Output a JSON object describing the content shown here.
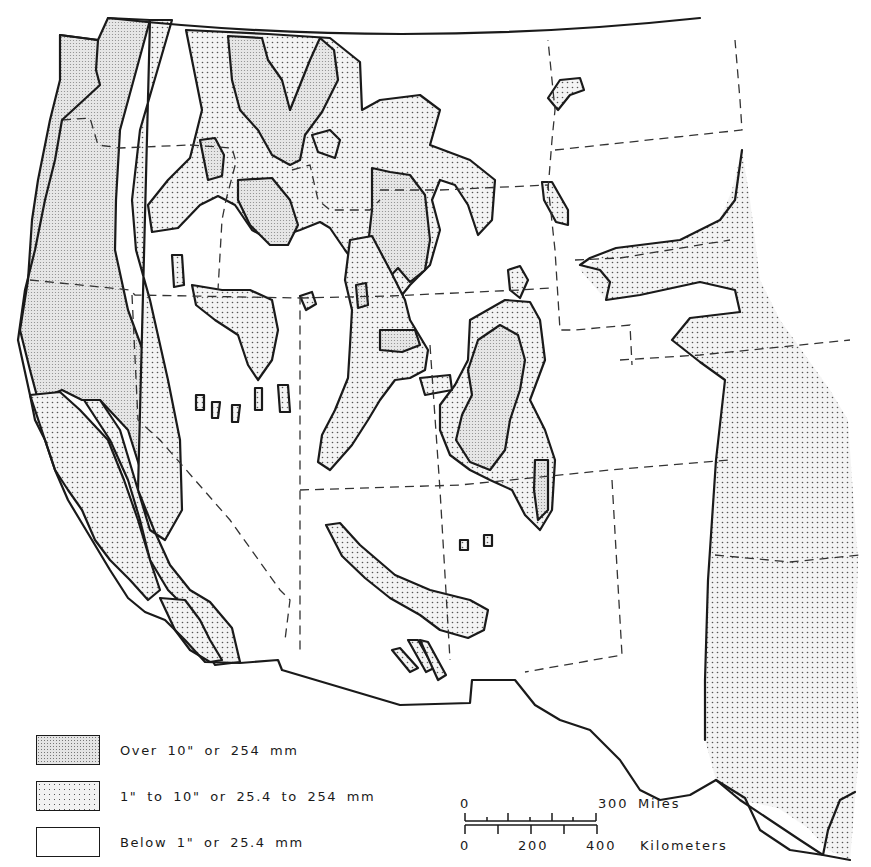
{
  "map": {
    "subject": "Western United States regional map with three shaded classes",
    "colors": {
      "outline": "#1a1a1a",
      "heavy_fill": "#e4e4e4",
      "light_fill": "#f2f2f2",
      "none_fill": "#ffffff"
    }
  },
  "legend": {
    "items": [
      {
        "pattern": "dense-stipple",
        "label": "Over  10\"  or  254 mm"
      },
      {
        "pattern": "sparse-stipple",
        "label": "1\"  to  10\"  or  25.4  to  254 mm"
      },
      {
        "pattern": "blank",
        "label": "Below  1\"  or  25.4 mm"
      }
    ]
  },
  "scale_bar": {
    "miles": {
      "start": "0",
      "end": "300",
      "unit": "Miles"
    },
    "kilometers": {
      "ticks": [
        "0",
        "200",
        "400"
      ],
      "unit": "Kilometers"
    }
  }
}
